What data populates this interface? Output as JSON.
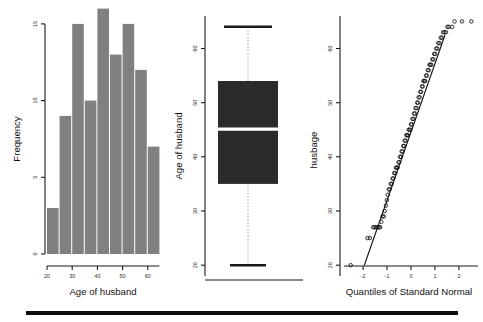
{
  "figure": {
    "background": "#ffffff",
    "bar_color": "#808080",
    "box_color": "#2b2b2b",
    "median_color": "#ffffff",
    "axis_color": "#1a1a1a"
  },
  "panels": {
    "histogram": {
      "xlabel": "Age of husband",
      "ylabel": "Frequency",
      "yticks": [
        "0",
        "5",
        "10",
        "15"
      ],
      "xticks": [
        "20",
        "30",
        "40",
        "50",
        "60"
      ]
    },
    "boxplot": {
      "ylabel": "Age of husband",
      "yticks": [
        "20",
        "30",
        "40",
        "50",
        "60"
      ]
    },
    "qqplot": {
      "xlabel": "Quantiles of Standard Normal",
      "ylabel": "husbage",
      "yticks": [
        "20",
        "30",
        "40",
        "50",
        "60"
      ],
      "xticks": [
        "-2",
        "-1",
        "0",
        "1",
        "2"
      ]
    }
  },
  "chart_data": [
    {
      "type": "bar",
      "title": "Histogram of husband age",
      "xlabel": "Age of husband",
      "ylabel": "Frequency",
      "categories": [
        "20-25",
        "25-30",
        "30-35",
        "35-40",
        "40-45",
        "45-50",
        "50-55",
        "55-60",
        "60-65"
      ],
      "bin_edges": [
        20,
        25,
        30,
        35,
        40,
        45,
        50,
        55,
        60,
        65
      ],
      "values": [
        3,
        9,
        15,
        10,
        16,
        13,
        15,
        12,
        7
      ],
      "xlim": [
        20,
        65
      ],
      "ylim": [
        0,
        16
      ],
      "yticks": [
        0,
        5,
        10,
        15
      ],
      "xticks": [
        20,
        30,
        40,
        50,
        60
      ],
      "grid": false,
      "legend": "none"
    },
    {
      "type": "box",
      "title": "Boxplot of husband age",
      "xlabel": "",
      "ylabel": "Age of husband",
      "ylim": [
        18,
        66
      ],
      "yticks": [
        20,
        30,
        40,
        50,
        60
      ],
      "series": [
        {
          "name": "Age of husband",
          "min": 20,
          "q1": 35,
          "median": 44,
          "q3": 54,
          "max": 64,
          "outliers": []
        }
      ],
      "grid": false,
      "legend": "none"
    },
    {
      "type": "scatter",
      "title": "Normal Q-Q plot of husband age",
      "xlabel": "Quantiles of Standard Normal",
      "ylabel": "husbage",
      "xlim": [
        -2.8,
        2.8
      ],
      "ylim": [
        18,
        66
      ],
      "xticks": [
        -2,
        -1,
        0,
        1,
        2
      ],
      "yticks": [
        20,
        30,
        40,
        50,
        60
      ],
      "grid": false,
      "legend": "none",
      "reference_line": {
        "name": "qq-reference-line",
        "x": [
          -1.95,
          1.42
        ],
        "y": [
          20.0,
          62.5
        ]
      },
      "series": [
        {
          "name": "husbage quantiles",
          "x": [
            -2.52,
            -1.82,
            -1.72,
            -1.58,
            -1.52,
            -1.46,
            -1.4,
            -1.34,
            -1.29,
            -1.24,
            -1.19,
            -1.14,
            -1.1,
            -1.05,
            -1.01,
            -0.97,
            -0.93,
            -0.89,
            -0.85,
            -0.81,
            -0.77,
            -0.74,
            -0.7,
            -0.66,
            -0.63,
            -0.59,
            -0.56,
            -0.52,
            -0.49,
            -0.46,
            -0.42,
            -0.39,
            -0.36,
            -0.32,
            -0.29,
            -0.26,
            -0.23,
            -0.19,
            -0.16,
            -0.13,
            -0.1,
            -0.06,
            -0.03,
            0.0,
            0.03,
            0.06,
            0.1,
            0.13,
            0.16,
            0.19,
            0.23,
            0.26,
            0.29,
            0.32,
            0.36,
            0.39,
            0.42,
            0.46,
            0.49,
            0.52,
            0.56,
            0.59,
            0.63,
            0.66,
            0.7,
            0.74,
            0.77,
            0.81,
            0.85,
            0.89,
            0.93,
            0.97,
            1.01,
            1.05,
            1.1,
            1.14,
            1.19,
            1.24,
            1.29,
            1.34,
            1.4,
            1.46,
            1.52,
            1.58,
            1.72,
            1.82,
            2.13,
            2.52
          ],
          "y": [
            20,
            25,
            25,
            27,
            27,
            27,
            27,
            27,
            27,
            28,
            29,
            29,
            30,
            31,
            32,
            33,
            34,
            34,
            35,
            35,
            36,
            36,
            37,
            37,
            38,
            38,
            38,
            39,
            39,
            40,
            40,
            41,
            41,
            42,
            42,
            43,
            43,
            44,
            44,
            44,
            45,
            45,
            45,
            46,
            46,
            47,
            47,
            48,
            48,
            49,
            49,
            50,
            50,
            51,
            51,
            52,
            52,
            53,
            53,
            54,
            54,
            54,
            55,
            55,
            56,
            56,
            57,
            57,
            57,
            58,
            58,
            59,
            59,
            60,
            60,
            61,
            61,
            62,
            62,
            63,
            63,
            63,
            64,
            64,
            64,
            65,
            65,
            65
          ]
        }
      ]
    }
  ]
}
